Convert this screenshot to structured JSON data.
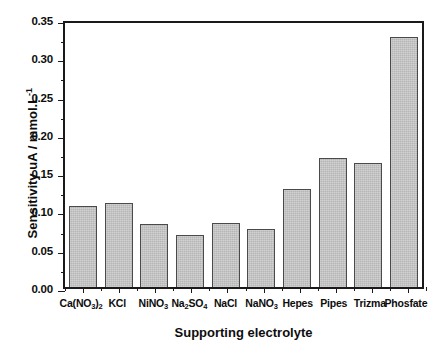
{
  "chart_data": {
    "type": "bar",
    "title": "",
    "xlabel": "Supporting electrolyte",
    "ylabel": "Sensitivity uA / mmol.L",
    "ylabel_superscript": "-1",
    "categories": [
      "Ca(NO3)2",
      "KCl",
      "NiNO3",
      "Na2SO4",
      "NaCl",
      "NaNO3",
      "Hepes",
      "Pipes",
      "Trizma",
      "Phosfate"
    ],
    "category_labels": [
      {
        "base": "Ca(NO",
        "sub": "3",
        "mid": ")",
        "sub2": "2",
        "tail": ""
      },
      {
        "base": "KCl",
        "sub": "",
        "mid": "",
        "sub2": "",
        "tail": ""
      },
      {
        "base": "NiNO",
        "sub": "3",
        "mid": "",
        "sub2": "",
        "tail": ""
      },
      {
        "base": "Na",
        "sub": "2",
        "mid": "SO",
        "sub2": "4",
        "tail": ""
      },
      {
        "base": "NaCl",
        "sub": "",
        "mid": "",
        "sub2": "",
        "tail": ""
      },
      {
        "base": "NaNO",
        "sub": "3",
        "mid": "",
        "sub2": "",
        "tail": ""
      },
      {
        "base": "Hepes",
        "sub": "",
        "mid": "",
        "sub2": "",
        "tail": ""
      },
      {
        "base": "Pipes",
        "sub": "",
        "mid": "",
        "sub2": "",
        "tail": ""
      },
      {
        "base": "Trizma",
        "sub": "",
        "mid": "",
        "sub2": "",
        "tail": ""
      },
      {
        "base": "Phosfate",
        "sub": "",
        "mid": "",
        "sub2": "",
        "tail": ""
      }
    ],
    "values": [
      0.106,
      0.11,
      0.082,
      0.068,
      0.084,
      0.076,
      0.128,
      0.168,
      0.162,
      0.327
    ],
    "ylim": [
      0.0,
      0.35
    ],
    "ytick_labels": [
      "0.00",
      "0.05",
      "0.10",
      "0.15",
      "0.20",
      "0.25",
      "0.30",
      "0.35"
    ],
    "ytick_values": [
      0.0,
      0.05,
      0.1,
      0.15,
      0.2,
      0.25,
      0.3,
      0.35
    ],
    "yminor_step": 0.025,
    "grid": false,
    "legend": false,
    "bar_fill_color": "#b6b6b6",
    "bar_edge_color": "#4a4a4a",
    "axis_color": "#1a1a1a",
    "background_color": "#ffffff"
  }
}
